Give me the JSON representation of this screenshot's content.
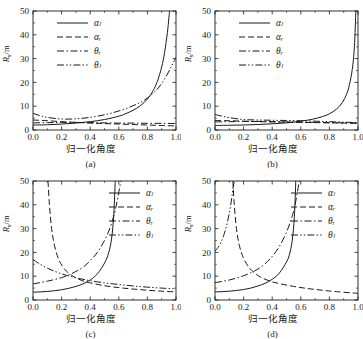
{
  "figure": {
    "name": "four-panel-line-chart",
    "background": "#ffffff",
    "line_color": "#1a1a1a"
  },
  "chart_data": [
    {
      "type": "line",
      "panel": "a",
      "caption": "(a)",
      "title": "",
      "xlabel": "归一化角度",
      "ylabel": "R_s/m",
      "ylabel_text": "R",
      "ylabel_sub": "s",
      "ylabel_unit": "/m",
      "xlim": [
        0.0,
        1.0
      ],
      "ylim": [
        0,
        50
      ],
      "xticks": [
        0.0,
        0.2,
        0.4,
        0.6,
        0.8,
        1.0
      ],
      "xticklabels": [
        "0.0",
        "0.2",
        "0.4",
        "0.6",
        "0.8",
        "1.0"
      ],
      "yticks": [
        0,
        10,
        20,
        30,
        40,
        50
      ],
      "yticklabels": [
        "0",
        "10",
        "20",
        "30",
        "40",
        "50"
      ],
      "grid": false,
      "legend_position": "upper-left",
      "legend": [
        {
          "label": "αₗ",
          "style": "solid"
        },
        {
          "label": "αᵣ",
          "style": "dashed"
        },
        {
          "label": "θᵣ",
          "style": "dashdot"
        },
        {
          "label": "θₗ",
          "style": "dashdotdot"
        }
      ],
      "series": [
        {
          "name": "αₗ",
          "style": "solid",
          "x": [
            0.0,
            0.1,
            0.2,
            0.3,
            0.4,
            0.5,
            0.6,
            0.65,
            0.7,
            0.75,
            0.8,
            0.84,
            0.87,
            0.9,
            0.92,
            0.94,
            0.95,
            0.955
          ],
          "values": [
            2.1,
            2.2,
            2.5,
            2.9,
            3.5,
            4.4,
            5.8,
            6.9,
            8.3,
            10.2,
            13.0,
            16.5,
            20.5,
            26.5,
            32.5,
            41.0,
            47.0,
            50.0
          ]
        },
        {
          "name": "αᵣ",
          "style": "dashed",
          "x": [
            0.0,
            0.1,
            0.2,
            0.3,
            0.4,
            0.5,
            0.6,
            0.7,
            0.8,
            0.9,
            1.0
          ],
          "values": [
            4.2,
            3.9,
            3.5,
            3.2,
            2.9,
            2.7,
            2.5,
            2.3,
            2.1,
            1.9,
            1.7
          ]
        },
        {
          "name": "θᵣ",
          "style": "dashdot",
          "x": [
            0.0,
            0.1,
            0.2,
            0.3,
            0.4,
            0.5,
            0.6,
            0.7,
            0.8,
            0.9,
            1.0
          ],
          "values": [
            3.0,
            3.1,
            3.2,
            3.2,
            3.1,
            3.0,
            2.9,
            2.9,
            2.8,
            2.8,
            2.7
          ]
        },
        {
          "name": "θₗ",
          "style": "dashdotdot",
          "x": [
            0.0,
            0.05,
            0.1,
            0.2,
            0.3,
            0.4,
            0.5,
            0.6,
            0.7,
            0.78,
            0.85,
            0.9,
            0.94,
            0.97,
            1.0
          ],
          "values": [
            7.0,
            6.0,
            5.3,
            4.6,
            4.7,
            5.3,
            6.4,
            8.0,
            10.2,
            12.6,
            16.0,
            19.5,
            23.5,
            27.0,
            30.5
          ]
        }
      ]
    },
    {
      "type": "line",
      "panel": "b",
      "caption": "(b)",
      "title": "",
      "xlabel": "归一化角度",
      "ylabel": "R_s/m",
      "ylabel_text": "R",
      "ylabel_sub": "s",
      "ylabel_unit": "/m",
      "xlim": [
        0.0,
        1.0
      ],
      "ylim": [
        0,
        50
      ],
      "xticks": [
        0.0,
        0.2,
        0.4,
        0.6,
        0.8,
        1.0
      ],
      "xticklabels": [
        "0.0",
        "0.2",
        "0.4",
        "0.6",
        "0.8",
        "1.0"
      ],
      "yticks": [
        0,
        10,
        20,
        30,
        40,
        50
      ],
      "yticklabels": [
        "0",
        "10",
        "20",
        "30",
        "40",
        "50"
      ],
      "grid": false,
      "legend_position": "upper-left",
      "legend": [
        {
          "label": "αₗ",
          "style": "solid"
        },
        {
          "label": "αᵣ",
          "style": "dashed"
        },
        {
          "label": "θᵣ",
          "style": "dashdot"
        },
        {
          "label": "θₗ",
          "style": "dashdotdot"
        }
      ],
      "series": [
        {
          "name": "αₗ",
          "style": "solid",
          "x": [
            0.0,
            0.1,
            0.2,
            0.3,
            0.4,
            0.5,
            0.6,
            0.68,
            0.75,
            0.8,
            0.85,
            0.89,
            0.92,
            0.94,
            0.96,
            0.975,
            0.985
          ],
          "values": [
            1.9,
            2.0,
            2.1,
            2.3,
            2.6,
            3.0,
            3.7,
            4.5,
            5.6,
            6.8,
            8.8,
            11.5,
            15.0,
            19.0,
            25.5,
            35.0,
            50.0
          ]
        },
        {
          "name": "αᵣ",
          "style": "dashed",
          "x": [
            0.0,
            0.1,
            0.2,
            0.3,
            0.4,
            0.5,
            0.6,
            0.7,
            0.8,
            0.9,
            1.0
          ],
          "values": [
            4.0,
            3.9,
            3.7,
            3.5,
            3.4,
            3.3,
            3.2,
            3.1,
            3.0,
            2.9,
            2.8
          ]
        },
        {
          "name": "θᵣ",
          "style": "dashdot",
          "x": [
            0.0,
            0.1,
            0.2,
            0.3,
            0.4,
            0.5,
            0.6,
            0.7,
            0.8,
            0.9,
            1.0
          ],
          "values": [
            3.4,
            3.5,
            3.6,
            3.6,
            3.5,
            3.4,
            3.3,
            3.2,
            3.1,
            3.0,
            2.9
          ]
        },
        {
          "name": "θₗ",
          "style": "dashdotdot",
          "x": [
            0.0,
            0.05,
            0.1,
            0.2,
            0.3,
            0.4,
            0.5,
            0.6,
            0.7,
            0.8,
            0.9,
            1.0
          ],
          "values": [
            6.5,
            5.8,
            5.2,
            4.4,
            4.2,
            4.1,
            4.0,
            3.9,
            3.7,
            3.5,
            3.3,
            3.1
          ]
        }
      ]
    },
    {
      "type": "line",
      "panel": "c",
      "caption": "(c)",
      "title": "",
      "xlabel": "归一化角度",
      "ylabel": "R_s/m",
      "ylabel_text": "R",
      "ylabel_sub": "s",
      "ylabel_unit": "/m",
      "xlim": [
        0.0,
        1.0
      ],
      "ylim": [
        0,
        50
      ],
      "xticks": [
        0.0,
        0.2,
        0.4,
        0.6,
        0.8,
        1.0
      ],
      "xticklabels": [
        "0.0",
        "0.2",
        "0.4",
        "0.6",
        "0.8",
        "1.0"
      ],
      "yticks": [
        0,
        10,
        20,
        30,
        40,
        50
      ],
      "yticklabels": [
        "0",
        "10",
        "20",
        "30",
        "40",
        "50"
      ],
      "grid": false,
      "legend_position": "upper-right",
      "legend": [
        {
          "label": "αₗ",
          "style": "solid"
        },
        {
          "label": "αᵣ",
          "style": "dashed"
        },
        {
          "label": "θᵣ",
          "style": "dashdot"
        },
        {
          "label": "θₗ",
          "style": "dashdotdot"
        }
      ],
      "series": [
        {
          "name": "αₗ",
          "style": "solid",
          "x": [
            0.0,
            0.05,
            0.1,
            0.15,
            0.2,
            0.25,
            0.3,
            0.35,
            0.4,
            0.45,
            0.5,
            0.53,
            0.55,
            0.565,
            0.575
          ],
          "values": [
            3.3,
            3.4,
            3.6,
            3.9,
            4.3,
            4.9,
            5.7,
            6.8,
            8.4,
            11.0,
            15.5,
            20.0,
            26.0,
            36.0,
            50.0
          ]
        },
        {
          "name": "αᵣ",
          "style": "dashed",
          "x": [
            0.105,
            0.115,
            0.13,
            0.15,
            0.18,
            0.22,
            0.26,
            0.3,
            0.35,
            0.4,
            0.5,
            0.6,
            0.7,
            0.8,
            0.9,
            1.0
          ],
          "values": [
            50.0,
            40.0,
            30.0,
            23.0,
            17.0,
            13.0,
            10.8,
            9.3,
            8.0,
            7.2,
            6.0,
            5.2,
            4.6,
            4.1,
            3.7,
            3.4
          ]
        },
        {
          "name": "θᵣ",
          "style": "dashdot",
          "x": [
            0.0,
            0.05,
            0.1,
            0.15,
            0.2,
            0.25,
            0.3,
            0.35,
            0.4,
            0.45,
            0.5,
            0.54,
            0.57,
            0.59,
            0.605,
            0.615
          ],
          "values": [
            6.8,
            7.3,
            7.9,
            8.6,
            9.4,
            10.5,
            12.0,
            13.8,
            16.5,
            20.0,
            25.0,
            30.5,
            36.5,
            42.0,
            47.0,
            50.0
          ]
        },
        {
          "name": "θₗ",
          "style": "dashdotdot",
          "x": [
            0.0,
            0.05,
            0.1,
            0.15,
            0.2,
            0.25,
            0.3,
            0.35,
            0.4,
            0.5,
            0.6,
            0.7,
            0.8,
            0.9,
            1.0
          ],
          "values": [
            17.0,
            15.0,
            13.4,
            12.1,
            11.0,
            10.1,
            9.3,
            8.7,
            8.1,
            7.2,
            6.5,
            5.9,
            5.4,
            5.0,
            4.7
          ]
        }
      ]
    },
    {
      "type": "line",
      "panel": "d",
      "caption": "(d)",
      "title": "",
      "xlabel": "归一化角度",
      "ylabel": "R_s/m",
      "ylabel_text": "R",
      "ylabel_sub": "s",
      "ylabel_unit": "/m",
      "xlim": [
        0.0,
        1.0
      ],
      "ylim": [
        0,
        50
      ],
      "xticks": [
        0.0,
        0.2,
        0.4,
        0.6,
        0.8,
        1.0
      ],
      "xticklabels": [
        "0.0",
        "0.2",
        "0.4",
        "0.6",
        "0.8",
        "1.0"
      ],
      "yticks": [
        0,
        10,
        20,
        30,
        40,
        50
      ],
      "yticklabels": [
        "0",
        "10",
        "20",
        "30",
        "40",
        "50"
      ],
      "grid": false,
      "legend_position": "upper-right",
      "legend": [
        {
          "label": "αₗ",
          "style": "solid"
        },
        {
          "label": "αᵣ",
          "style": "dashed"
        },
        {
          "label": "θᵣ",
          "style": "dashdot"
        },
        {
          "label": "θₗ",
          "style": "dashdotdot"
        }
      ],
      "series": [
        {
          "name": "αₗ",
          "style": "solid",
          "x": [
            0.0,
            0.05,
            0.1,
            0.15,
            0.2,
            0.25,
            0.3,
            0.35,
            0.4,
            0.45,
            0.5,
            0.52,
            0.54,
            0.555,
            0.565
          ],
          "values": [
            3.4,
            3.5,
            3.7,
            4.0,
            4.4,
            5.0,
            5.9,
            7.0,
            8.7,
            11.3,
            16.0,
            19.0,
            25.0,
            35.0,
            50.0
          ]
        },
        {
          "name": "αᵣ",
          "style": "dashed",
          "x": [
            0.125,
            0.135,
            0.15,
            0.17,
            0.2,
            0.24,
            0.28,
            0.32,
            0.38,
            0.45,
            0.55,
            0.65,
            0.75,
            0.85,
            1.0
          ],
          "values": [
            50.0,
            40.0,
            30.0,
            23.0,
            17.5,
            13.5,
            11.2,
            9.6,
            8.0,
            6.9,
            5.7,
            4.8,
            4.1,
            3.5,
            2.8
          ]
        },
        {
          "name": "θᵣ",
          "style": "dashdot",
          "x": [
            0.0,
            0.05,
            0.1,
            0.15,
            0.2,
            0.25,
            0.3,
            0.35,
            0.4,
            0.45,
            0.5,
            0.53,
            0.555,
            0.575,
            0.59
          ],
          "values": [
            7.3,
            7.8,
            8.4,
            9.2,
            10.2,
            11.4,
            13.0,
            15.2,
            18.3,
            22.5,
            28.5,
            33.5,
            38.5,
            45.0,
            50.0
          ]
        },
        {
          "name": "θₗ",
          "style": "dashdotdot",
          "x": [
            0.0,
            0.02,
            0.04,
            0.06,
            0.08,
            0.1,
            0.115,
            0.125,
            0.135
          ],
          "values": [
            20.5,
            22.0,
            24.0,
            27.0,
            31.0,
            36.5,
            42.0,
            46.5,
            50.0
          ]
        }
      ]
    }
  ]
}
